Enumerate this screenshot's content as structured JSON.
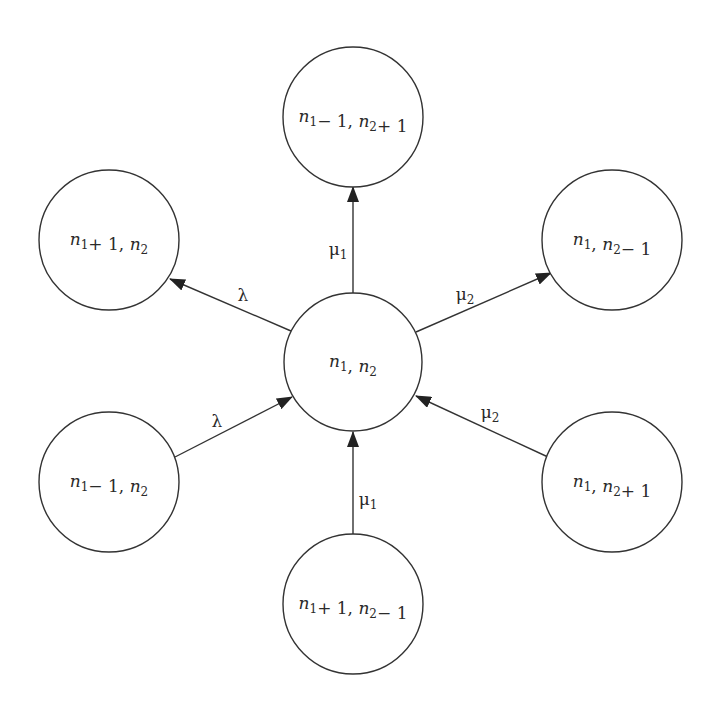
{
  "diagram": {
    "type": "state-transition",
    "colors": {
      "stroke": "#333333",
      "text": "#2a2a2a",
      "background": "#ffffff"
    },
    "nodes": [
      {
        "id": "center",
        "cx": 353,
        "cy": 362,
        "r": 69,
        "label": {
          "parts": [
            [
              "n",
              "1"
            ],
            [
              ", "
            ],
            [
              "n",
              "2"
            ]
          ]
        },
        "text": "n1, n2"
      },
      {
        "id": "top",
        "cx": 353,
        "cy": 117,
        "r": 70,
        "label": {
          "parts": [
            [
              "n",
              "1"
            ],
            [
              "− 1, "
            ],
            [
              "n",
              "2"
            ],
            [
              "+ 1"
            ]
          ]
        },
        "text": "n1 − 1, n2 + 1"
      },
      {
        "id": "top-left",
        "cx": 109,
        "cy": 240,
        "r": 70,
        "label": {
          "parts": [
            [
              "n",
              "1"
            ],
            [
              "+ 1, "
            ],
            [
              "n",
              "2"
            ]
          ]
        },
        "text": "n1 + 1, n2"
      },
      {
        "id": "top-right",
        "cx": 612,
        "cy": 240,
        "r": 70,
        "label": {
          "parts": [
            [
              "n",
              "1"
            ],
            [
              ", "
            ],
            [
              "n",
              "2"
            ],
            [
              "− 1"
            ]
          ]
        },
        "text": "n1, n2 − 1"
      },
      {
        "id": "bottom-left",
        "cx": 109,
        "cy": 482,
        "r": 70,
        "label": {
          "parts": [
            [
              "n",
              "1"
            ],
            [
              "− 1, "
            ],
            [
              "n",
              "2"
            ]
          ]
        },
        "text": "n1 − 1, n2"
      },
      {
        "id": "bottom-right",
        "cx": 612,
        "cy": 482,
        "r": 70,
        "label": {
          "parts": [
            [
              "n",
              "1"
            ],
            [
              ", "
            ],
            [
              "n",
              "2"
            ],
            [
              "+ 1"
            ]
          ]
        },
        "text": "n1, n2 + 1"
      },
      {
        "id": "bottom",
        "cx": 353,
        "cy": 604,
        "r": 70,
        "label": {
          "parts": [
            [
              "n",
              "1"
            ],
            [
              "+ 1, "
            ],
            [
              "n",
              "2"
            ],
            [
              "− 1"
            ]
          ]
        },
        "text": "n1 + 1, n2 − 1"
      }
    ],
    "edges": [
      {
        "id": "center-to-top",
        "from": "center",
        "to": "top",
        "x1": 353,
        "y1": 293,
        "x2": 353,
        "y2": 187,
        "label": {
          "sym": "μ",
          "sub": "1",
          "x": 338,
          "y": 250
        },
        "text": "μ1"
      },
      {
        "id": "center-to-top-left",
        "from": "center",
        "to": "top-left",
        "x1": 291,
        "y1": 331,
        "x2": 170,
        "y2": 279,
        "label": {
          "sym": "λ",
          "sub": "",
          "x": 243,
          "y": 296
        },
        "text": "λ"
      },
      {
        "id": "center-to-top-right",
        "from": "center",
        "to": "top-right",
        "x1": 416,
        "y1": 332,
        "x2": 551,
        "y2": 273,
        "label": {
          "sym": "μ",
          "sub": "2",
          "x": 465,
          "y": 295
        },
        "text": "μ2"
      },
      {
        "id": "bottom-left-to-center",
        "from": "bottom-left",
        "to": "center",
        "x1": 175,
        "y1": 457,
        "x2": 292,
        "y2": 397,
        "label": {
          "sym": "λ",
          "sub": "",
          "x": 217,
          "y": 422
        },
        "text": "λ"
      },
      {
        "id": "bottom-right-to-center",
        "from": "bottom-right",
        "to": "center",
        "x1": 548,
        "y1": 457,
        "x2": 416,
        "y2": 396,
        "label": {
          "sym": "μ",
          "sub": "2",
          "x": 490,
          "y": 413
        },
        "text": "μ2"
      },
      {
        "id": "bottom-to-center",
        "from": "bottom",
        "to": "center",
        "x1": 353,
        "y1": 534,
        "x2": 353,
        "y2": 432,
        "label": {
          "sym": "μ",
          "sub": "1",
          "x": 368,
          "y": 500
        },
        "text": "μ1"
      }
    ]
  }
}
